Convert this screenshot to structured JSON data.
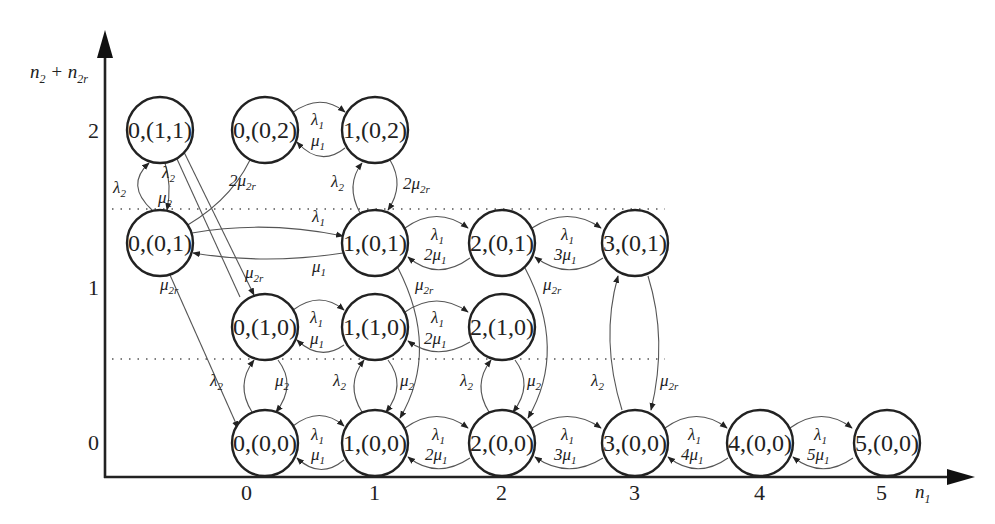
{
  "diagram": {
    "type": "state-transition-diagram",
    "axes": {
      "y_title": "n2 + n2r",
      "x_title": "n1",
      "y_ticks": [
        {
          "label": "2",
          "y": 130
        },
        {
          "label": "1",
          "y": 288
        },
        {
          "label": "0",
          "y": 443
        }
      ],
      "x_ticks": [
        {
          "label": "0",
          "x": 252
        },
        {
          "label": "1",
          "x": 375
        },
        {
          "label": "2",
          "x": 502
        },
        {
          "label": "3",
          "x": 635
        },
        {
          "label": "4",
          "x": 760
        },
        {
          "label": "5",
          "x": 882
        }
      ]
    },
    "nodes": [
      {
        "id": "n0_11",
        "label": "0,(1,1)",
        "x": 160,
        "y": 130
      },
      {
        "id": "n0_02",
        "label": "0,(0,2)",
        "x": 265,
        "y": 130
      },
      {
        "id": "n1_02",
        "label": "1,(0,2)",
        "x": 375,
        "y": 130
      },
      {
        "id": "n0_01",
        "label": "0,(0,1)",
        "x": 160,
        "y": 243
      },
      {
        "id": "n1_01",
        "label": "1,(0,1)",
        "x": 375,
        "y": 243
      },
      {
        "id": "n2_01",
        "label": "2,(0,1)",
        "x": 502,
        "y": 243
      },
      {
        "id": "n3_01",
        "label": "3,(0,1)",
        "x": 635,
        "y": 243
      },
      {
        "id": "n0_10",
        "label": "0,(1,0)",
        "x": 265,
        "y": 327
      },
      {
        "id": "n1_10",
        "label": "1,(1,0)",
        "x": 375,
        "y": 327
      },
      {
        "id": "n2_10",
        "label": "2,(1,0)",
        "x": 502,
        "y": 327
      },
      {
        "id": "n0_00",
        "label": "0,(0,0)",
        "x": 265,
        "y": 443
      },
      {
        "id": "n1_00",
        "label": "1,(0,0)",
        "x": 375,
        "y": 443
      },
      {
        "id": "n2_00",
        "label": "2,(0,0)",
        "x": 502,
        "y": 443
      },
      {
        "id": "n3_00",
        "label": "3,(0,0)",
        "x": 635,
        "y": 443
      },
      {
        "id": "n4_00",
        "label": "4,(0,0)",
        "x": 760,
        "y": 443
      },
      {
        "id": "n5_00",
        "label": "5,(0,0)",
        "x": 887,
        "y": 443
      }
    ],
    "rate_labels": {
      "l1": "λ1",
      "l2": "λ2",
      "m1": "μ1",
      "m2": "μ2",
      "m2r": "μ2r",
      "two_m2r": "2μ2r",
      "two_m1": "2μ1",
      "three_m1": "3μ1",
      "four_m1": "4μ1",
      "five_m1": "5μ1"
    },
    "edges": [
      {
        "from": "0,(0,2)",
        "to": "1,(0,2)",
        "rate": "λ1"
      },
      {
        "from": "1,(0,2)",
        "to": "0,(0,2)",
        "rate": "μ1"
      },
      {
        "from": "0,(0,1)",
        "to": "0,(1,1)",
        "rate": "λ2"
      },
      {
        "from": "0,(1,1)",
        "to": "0,(0,1)",
        "rate": "μ2"
      },
      {
        "from": "0,(1,0)",
        "to": "0,(1,1)",
        "rate": "λ2"
      },
      {
        "from": "0,(1,1)",
        "to": "0,(1,0)",
        "rate": "μ2r"
      },
      {
        "from": "0,(0,2)",
        "to": "0,(0,1)",
        "rate": "2μ2r"
      },
      {
        "from": "1,(0,1)",
        "to": "1,(0,2)",
        "rate": "λ2"
      },
      {
        "from": "1,(0,2)",
        "to": "1,(0,1)",
        "rate": "2μ2r"
      },
      {
        "from": "0,(0,1)",
        "to": "1,(0,1)",
        "rate": "λ1"
      },
      {
        "from": "1,(0,1)",
        "to": "0,(0,1)",
        "rate": "μ1"
      },
      {
        "from": "1,(0,1)",
        "to": "2,(0,1)",
        "rate": "λ1"
      },
      {
        "from": "2,(0,1)",
        "to": "1,(0,1)",
        "rate": "2μ1"
      },
      {
        "from": "2,(0,1)",
        "to": "3,(0,1)",
        "rate": "λ1"
      },
      {
        "from": "3,(0,1)",
        "to": "2,(0,1)",
        "rate": "3μ1"
      },
      {
        "from": "0,(0,1)",
        "to": "0,(0,0)",
        "rate": "μ2r"
      },
      {
        "from": "1,(0,1)",
        "to": "1,(0,0)",
        "rate": "μ2r"
      },
      {
        "from": "2,(0,1)",
        "to": "2,(0,0)",
        "rate": "μ2r"
      },
      {
        "from": "3,(0,0)",
        "to": "3,(0,1)",
        "rate": "λ2"
      },
      {
        "from": "3,(0,1)",
        "to": "3,(0,0)",
        "rate": "μ2r"
      },
      {
        "from": "0,(1,0)",
        "to": "1,(1,0)",
        "rate": "λ1"
      },
      {
        "from": "1,(1,0)",
        "to": "0,(1,0)",
        "rate": "μ1"
      },
      {
        "from": "1,(1,0)",
        "to": "2,(1,0)",
        "rate": "λ1"
      },
      {
        "from": "2,(1,0)",
        "to": "1,(1,0)",
        "rate": "2μ1"
      },
      {
        "from": "0,(0,0)",
        "to": "0,(1,0)",
        "rate": "λ2"
      },
      {
        "from": "0,(1,0)",
        "to": "0,(0,0)",
        "rate": "μ2"
      },
      {
        "from": "1,(0,0)",
        "to": "1,(1,0)",
        "rate": "λ2"
      },
      {
        "from": "1,(1,0)",
        "to": "1,(0,0)",
        "rate": "μ2"
      },
      {
        "from": "2,(0,0)",
        "to": "2,(1,0)",
        "rate": "λ2"
      },
      {
        "from": "2,(1,0)",
        "to": "2,(0,0)",
        "rate": "μ2"
      },
      {
        "from": "0,(0,0)",
        "to": "1,(0,0)",
        "rate": "λ1"
      },
      {
        "from": "1,(0,0)",
        "to": "0,(0,0)",
        "rate": "μ1"
      },
      {
        "from": "1,(0,0)",
        "to": "2,(0,0)",
        "rate": "λ1"
      },
      {
        "from": "2,(0,0)",
        "to": "1,(0,0)",
        "rate": "2μ1"
      },
      {
        "from": "2,(0,0)",
        "to": "3,(0,0)",
        "rate": "λ1"
      },
      {
        "from": "3,(0,0)",
        "to": "2,(0,0)",
        "rate": "3μ1"
      },
      {
        "from": "3,(0,0)",
        "to": "4,(0,0)",
        "rate": "λ1"
      },
      {
        "from": "4,(0,0)",
        "to": "3,(0,0)",
        "rate": "4μ1"
      },
      {
        "from": "4,(0,0)",
        "to": "5,(0,0)",
        "rate": "λ1"
      },
      {
        "from": "5,(0,0)",
        "to": "4,(0,0)",
        "rate": "5μ1"
      }
    ]
  }
}
